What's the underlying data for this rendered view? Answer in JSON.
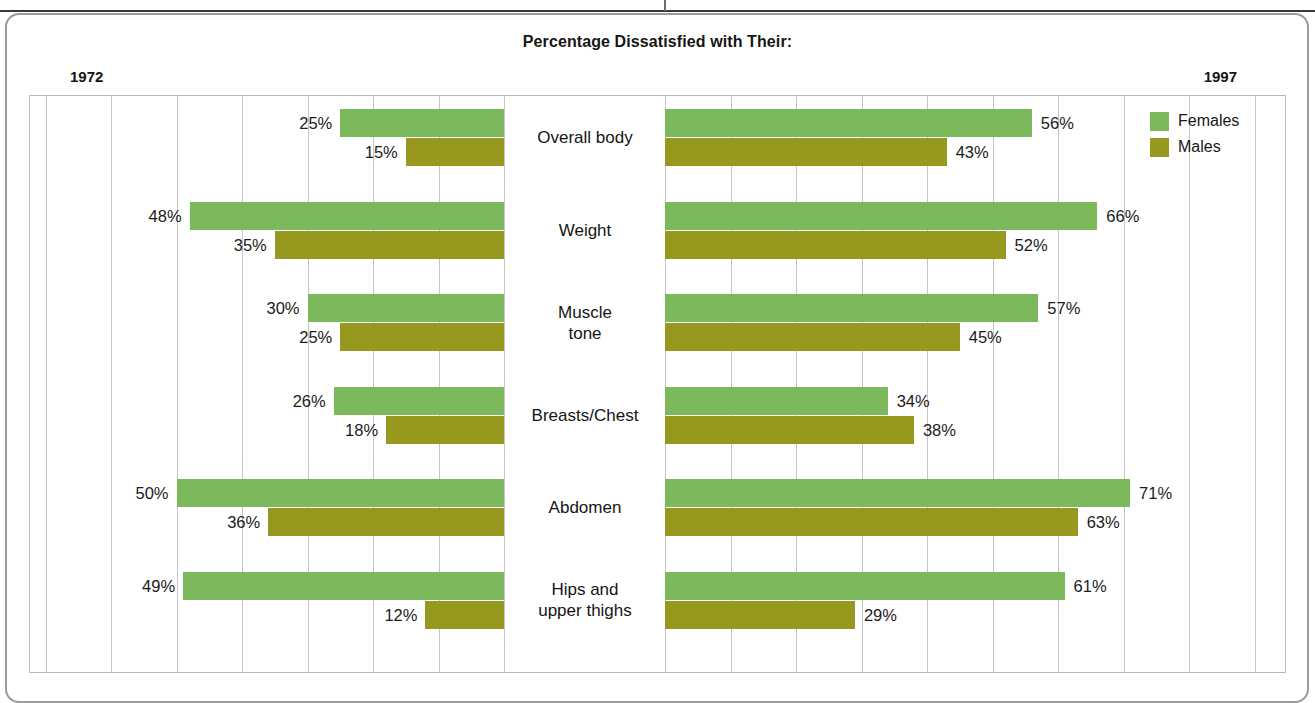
{
  "figure": {
    "title": "Percentage Dissatisfied with Their:",
    "left_year": "1972",
    "right_year": "1997"
  },
  "legend": {
    "position": "top-right",
    "items": [
      {
        "label": "Females",
        "color": "#7cb85c",
        "swatch": "female-swatch"
      },
      {
        "label": "Males",
        "color": "#96991e",
        "swatch": "male-swatch"
      }
    ]
  },
  "chart_data": {
    "type": "bar",
    "orientation": "horizontal",
    "layout": "back-to-back paired panels",
    "title": "Percentage Dissatisfied with Their:",
    "xlabel": "",
    "ylabel": "",
    "grid": true,
    "gridline_interval_percent": 10,
    "panels": [
      {
        "name": "1972",
        "label": "1972",
        "direction": "leftward",
        "xlim": [
          0,
          70
        ]
      },
      {
        "name": "1997",
        "label": "1997",
        "direction": "rightward",
        "xlim": [
          0,
          80
        ]
      }
    ],
    "categories": [
      "Overall body",
      "Weight",
      "Muscle tone",
      "Breasts/Chest",
      "Abdomen",
      "Hips and upper thighs"
    ],
    "category_lines": [
      [
        "Overall body"
      ],
      [
        "Weight"
      ],
      [
        "Muscle",
        "tone"
      ],
      [
        "Breasts/Chest"
      ],
      [
        "Abdomen"
      ],
      [
        "Hips and",
        "upper thighs"
      ]
    ],
    "series": [
      {
        "name": "Females",
        "color": "#7cb85c",
        "values_1972": [
          25,
          48,
          30,
          26,
          50,
          49
        ],
        "values_1997": [
          56,
          66,
          57,
          34,
          71,
          61
        ]
      },
      {
        "name": "Males",
        "color": "#96991e",
        "values_1972": [
          15,
          35,
          25,
          18,
          36,
          12
        ],
        "values_1997": [
          43,
          52,
          45,
          38,
          63,
          29
        ]
      }
    ],
    "data_labels": {
      "left_females": [
        "25%",
        "48%",
        "30%",
        "26%",
        "50%",
        "49%"
      ],
      "left_males": [
        "15%",
        "35%",
        "25%",
        "18%",
        "36%",
        "12%"
      ],
      "right_females": [
        "56%",
        "66%",
        "57%",
        "34%",
        "71%",
        "61%"
      ],
      "right_males": [
        "43%",
        "52%",
        "45%",
        "38%",
        "63%",
        "29%"
      ]
    }
  }
}
